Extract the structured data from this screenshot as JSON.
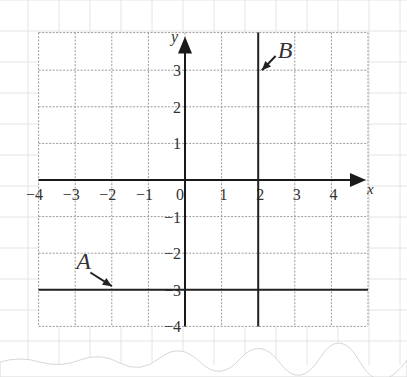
{
  "chart_data": {
    "type": "line",
    "title": "",
    "xlabel": "x",
    "ylabel": "y",
    "xlim": [
      -4,
      5
    ],
    "ylim": [
      -4,
      4
    ],
    "x_ticks": [
      -4,
      -3,
      -2,
      -1,
      0,
      1,
      2,
      3,
      4
    ],
    "y_ticks": [
      -4,
      -3,
      -2,
      -1,
      1,
      2,
      3
    ],
    "grid": true,
    "series": [
      {
        "name": "A",
        "kind": "horizontal",
        "equation": "y = -3",
        "value": -3,
        "label_at": [
          -2.75,
          -2.2
        ],
        "arrow_to": [
          -2,
          -2.9
        ]
      },
      {
        "name": "B",
        "kind": "vertical",
        "equation": "x = 2",
        "value": 2,
        "label_at": [
          2.75,
          3.55
        ],
        "arrow_to": [
          2.1,
          3.0
        ]
      }
    ]
  },
  "labels": {
    "x_axis": "x",
    "y_axis": "y",
    "line_a": "A",
    "line_b": "B",
    "origin": "0"
  },
  "colors": {
    "paper_grid": "#e4e4e4",
    "grid": "#9a9a9a",
    "axis": "#1a1a1a",
    "line": "#222222",
    "text": "#333333"
  }
}
